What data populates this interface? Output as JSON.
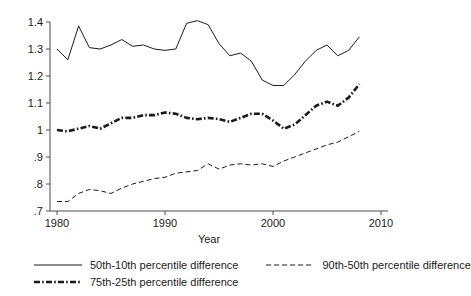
{
  "chart_data": {
    "type": "line",
    "title": "",
    "xlabel": "Year",
    "ylabel": "",
    "xlim": [
      1979,
      2010
    ],
    "ylim": [
      0.7,
      1.44
    ],
    "grid": false,
    "legend_position": "bottom",
    "x_ticks": [
      "1980",
      "1990",
      "2000",
      "2010"
    ],
    "x_tick_values": [
      1980,
      1990,
      2000,
      2010
    ],
    "y_ticks": [
      "1.4",
      "1.3",
      "1.2",
      "1.1",
      "1",
      ".9",
      ".8",
      ".7"
    ],
    "y_tick_values": [
      1.4,
      1.3,
      1.2,
      1.1,
      1.0,
      0.9,
      0.8,
      0.7
    ],
    "x": [
      1980,
      1981,
      1982,
      1983,
      1984,
      1985,
      1986,
      1987,
      1988,
      1989,
      1990,
      1991,
      1992,
      1993,
      1994,
      1995,
      1996,
      1997,
      1998,
      1999,
      2000,
      2001,
      2002,
      2003,
      2004,
      2005,
      2006,
      2007,
      2008
    ],
    "series": [
      {
        "name": "50th-10th percentile difference",
        "style": "solid",
        "values": [
          1.3,
          1.26,
          1.385,
          1.305,
          1.3,
          1.315,
          1.335,
          1.31,
          1.315,
          1.3,
          1.295,
          1.3,
          1.395,
          1.405,
          1.39,
          1.32,
          1.275,
          1.285,
          1.255,
          1.185,
          1.165,
          1.165,
          1.205,
          1.255,
          1.295,
          1.315,
          1.275,
          1.295,
          1.345
        ]
      },
      {
        "name": "75th-25th percentile difference",
        "style": "dashdot",
        "values": [
          1.0,
          0.995,
          1.005,
          1.015,
          1.005,
          1.025,
          1.045,
          1.045,
          1.055,
          1.055,
          1.065,
          1.06,
          1.045,
          1.04,
          1.045,
          1.04,
          1.03,
          1.045,
          1.06,
          1.06,
          1.035,
          1.005,
          1.02,
          1.055,
          1.09,
          1.105,
          1.09,
          1.12,
          1.17
        ]
      },
      {
        "name": "90th-50th percentile difference",
        "style": "dashed",
        "values": [
          0.735,
          0.735,
          0.765,
          0.78,
          0.775,
          0.765,
          0.785,
          0.8,
          0.81,
          0.82,
          0.825,
          0.84,
          0.845,
          0.85,
          0.875,
          0.855,
          0.87,
          0.875,
          0.87,
          0.875,
          0.865,
          0.885,
          0.9,
          0.915,
          0.93,
          0.945,
          0.955,
          0.975,
          0.995
        ]
      }
    ]
  },
  "legend": {
    "entries": [
      {
        "label": "50th-10th percentile difference",
        "style": "solid"
      },
      {
        "label": "90th-50th percentile difference",
        "style": "dashed"
      },
      {
        "label": "75th-25th percentile difference",
        "style": "dashdot"
      }
    ]
  }
}
